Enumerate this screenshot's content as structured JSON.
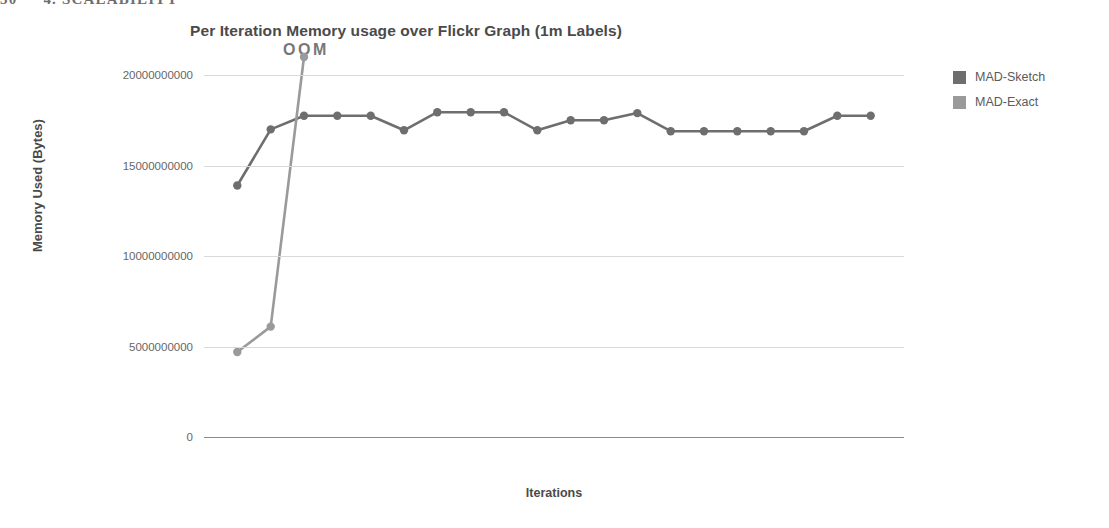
{
  "page_header": {
    "page_number": "30",
    "section": "4. SCALABILITY"
  },
  "figure": {
    "title": "Per Iteration Memory usage over Flickr Graph (1m Labels)",
    "annotation": "OOM",
    "legend_position": "right"
  },
  "legend": {
    "items": [
      {
        "label": "MAD-Sketch",
        "color": "#6e6e6e"
      },
      {
        "label": "MAD-Exact",
        "color": "#9a9a9a"
      }
    ]
  },
  "chart_data": {
    "type": "line",
    "title": "Per Iteration Memory usage over Flickr Graph (1m Labels)",
    "xlabel": "Iterations",
    "ylabel": "Memory Used (Bytes)",
    "grid": true,
    "legend_position": "right",
    "annotations": [
      {
        "text": "OOM",
        "x": 2.35,
        "y": 20000000000
      }
    ],
    "ylim": [
      0,
      21000000000
    ],
    "ytick_labels": [
      "20000000000",
      "15000000000",
      "10000000000",
      "5000000000",
      "0"
    ],
    "yticks": [
      20000000000,
      15000000000,
      10000000000,
      5000000000,
      0
    ],
    "xlim": [
      0,
      21
    ],
    "xtick_labels": [],
    "x": [
      1,
      2,
      3,
      4,
      5,
      6,
      7,
      8,
      9,
      10,
      11,
      12,
      13,
      14,
      15,
      16,
      17,
      18,
      19,
      20,
      21
    ],
    "series": [
      {
        "name": "MAD-Sketch",
        "color": "#6e6e6e",
        "values": [
          13900000000,
          17000000000,
          17750000000,
          17750000000,
          17750000000,
          16950000000,
          17950000000,
          17950000000,
          17950000000,
          16950000000,
          17500000000,
          17500000000,
          17900000000,
          16900000000,
          16900000000,
          16900000000,
          16900000000,
          16900000000,
          17750000000,
          17750000000,
          null
        ]
      },
      {
        "name": "MAD-Exact",
        "color": "#9a9a9a",
        "values": [
          4700000000,
          6100000000,
          21000000000,
          null,
          null,
          null,
          null,
          null,
          null,
          null,
          null,
          null,
          null,
          null,
          null,
          null,
          null,
          null,
          null,
          null,
          null
        ],
        "note": "terminates at out-of-memory"
      }
    ]
  }
}
